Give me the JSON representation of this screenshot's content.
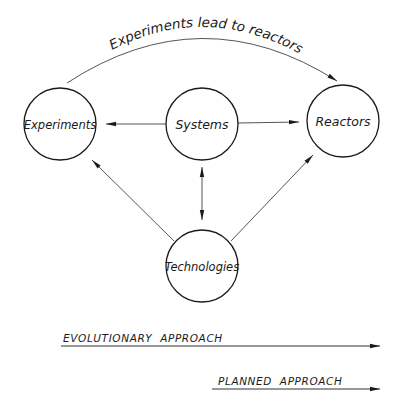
{
  "diagram": {
    "nodes": [
      {
        "id": "experiments",
        "label": "Experiments",
        "cx": 60,
        "cy": 124,
        "r": 36
      },
      {
        "id": "systems",
        "label": "Systems",
        "cx": 202,
        "cy": 124,
        "r": 36
      },
      {
        "id": "reactors",
        "label": "Reactors",
        "cx": 343,
        "cy": 121,
        "r": 36
      },
      {
        "id": "technologies",
        "label": "Technologies",
        "cx": 202,
        "cy": 266,
        "r": 36
      }
    ],
    "edges": [
      {
        "from": "systems",
        "to": "experiments",
        "direction": "forward"
      },
      {
        "from": "systems",
        "to": "reactors",
        "direction": "forward"
      },
      {
        "from": "systems",
        "to": "technologies",
        "direction": "both"
      },
      {
        "from": "technologies",
        "to": "experiments",
        "direction": "forward"
      },
      {
        "from": "technologies",
        "to": "reactors",
        "direction": "forward"
      },
      {
        "from": "experiments",
        "to": "reactors",
        "direction": "forward",
        "curved": true,
        "label": "Experiments lead to reactors"
      }
    ],
    "arc_label": "Experiments lead to reactors",
    "approaches": [
      {
        "label": "EVOLUTIONARY  APPROACH"
      },
      {
        "label": "PLANNED  APPROACH"
      }
    ]
  }
}
